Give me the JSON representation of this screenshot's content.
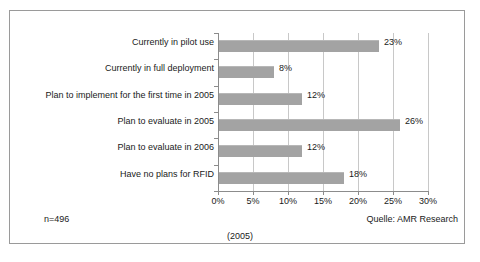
{
  "chart_data": {
    "type": "bar",
    "orientation": "horizontal",
    "title": "",
    "xlabel": "",
    "ylabel": "",
    "xlim": [
      0,
      30
    ],
    "grid": true,
    "legend": null,
    "categories": [
      "Currently in pilot use",
      "Currently in full deployment",
      "Plan to implement for the first time in 2005",
      "Plan to evaluate in 2005",
      "Plan to evaluate in 2006",
      "Have no plans for RFID"
    ],
    "values": [
      23,
      8,
      12,
      26,
      12,
      18
    ],
    "value_labels": [
      "23%",
      "8%",
      "12%",
      "26%",
      "12%",
      "18%"
    ],
    "xticks": [
      0,
      5,
      10,
      15,
      20,
      25,
      30
    ],
    "xtick_labels": [
      "0%",
      "5%",
      "10%",
      "15%",
      "20%",
      "25%",
      "30%"
    ],
    "bar_color": "#a3a3a3"
  },
  "annotations": {
    "sample_size": "n=496",
    "source": "Quelle: AMR Research",
    "caption": "(2005)"
  }
}
